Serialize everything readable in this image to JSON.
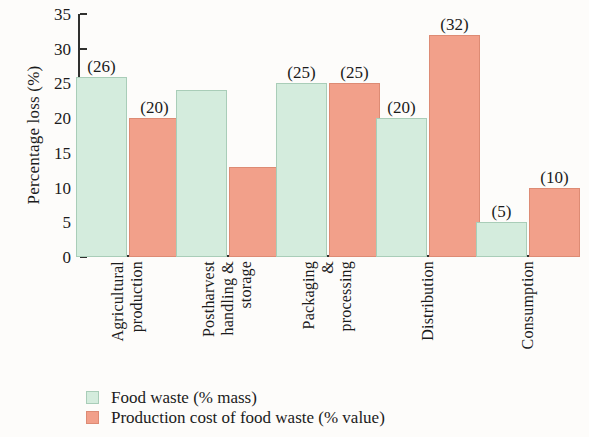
{
  "chart_data": {
    "type": "bar",
    "title": "",
    "xlabel": "",
    "ylabel": "Percentage loss (%)",
    "ylim": [
      0,
      35
    ],
    "yticks": [
      0,
      5,
      10,
      15,
      20,
      25,
      30,
      35
    ],
    "grid": false,
    "legend_position": "bottom-left",
    "categories": [
      "Agricultural production",
      "Postharvest handling & storage",
      "Packaging & processing",
      "Distribution",
      "Consumption"
    ],
    "category_lines": [
      [
        "Agricultural",
        "production"
      ],
      [
        "Postharvest",
        "handling &",
        "storage"
      ],
      [
        "Packaging",
        "&",
        "processing"
      ],
      [
        "Distribution"
      ],
      [
        "Consumption"
      ]
    ],
    "series": [
      {
        "name": "Food waste (% mass)",
        "color": "#d4ecdd",
        "values": [
          26,
          24,
          25,
          20,
          5
        ],
        "labels": [
          "(26)",
          "",
          "(25)",
          "(20)",
          "(5)"
        ]
      },
      {
        "name": "Production cost of food waste (% value)",
        "color": "#f2a08a",
        "values": [
          20,
          13,
          25,
          32,
          10
        ],
        "labels": [
          "(20)",
          "",
          "(25)",
          "(32)",
          "(10)"
        ]
      }
    ]
  },
  "axis": {
    "y_title": "Percentage loss (%)",
    "tick_labels": [
      "0",
      "5",
      "10",
      "15",
      "20",
      "25",
      "30",
      "35"
    ]
  },
  "legend": {
    "items": [
      {
        "label": "Food waste (% mass)",
        "color": "#d4ecdd"
      },
      {
        "label": "Production cost of food waste (% value)",
        "color": "#f2a08a"
      }
    ]
  }
}
